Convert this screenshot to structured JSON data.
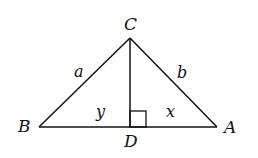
{
  "diagram": {
    "type": "geometry",
    "colors": {
      "stroke": "#111111",
      "background": "#ffffff"
    },
    "vertices": {
      "C": {
        "label": "C",
        "x": 130,
        "y": 38
      },
      "B": {
        "label": "B",
        "x": 39,
        "y": 127
      },
      "A": {
        "label": "A",
        "x": 217,
        "y": 127
      },
      "D": {
        "label": "D",
        "x": 130,
        "y": 127
      }
    },
    "side_labels": {
      "a": {
        "label": "a",
        "side": "BC"
      },
      "b": {
        "label": "b",
        "side": "CA"
      },
      "y": {
        "label": "y",
        "segment": "BD"
      },
      "x": {
        "label": "x",
        "segment": "DA"
      }
    },
    "right_angle": {
      "at": "D",
      "marker": "square"
    }
  }
}
